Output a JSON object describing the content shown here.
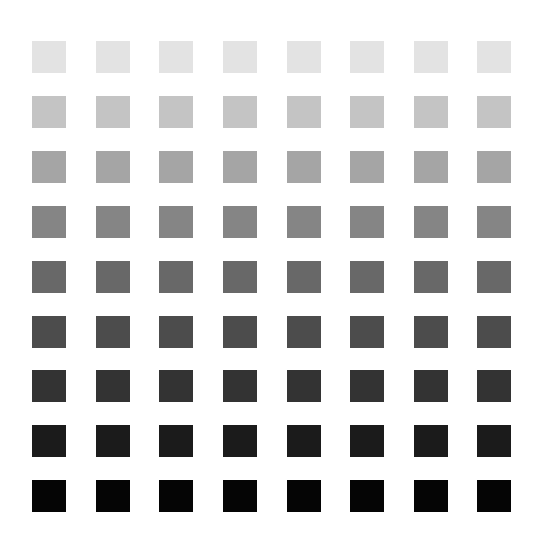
{
  "grid": {
    "columns": 8,
    "rows": 9,
    "col_x": [
      32,
      96,
      159,
      223,
      287,
      350,
      414,
      477
    ],
    "row_y": [
      41,
      96,
      151,
      206,
      261,
      316,
      370,
      425,
      480
    ],
    "square_width": 34,
    "square_height": 32,
    "row_colors": [
      "#e3e3e3",
      "#c4c4c4",
      "#a5a5a5",
      "#858585",
      "#686868",
      "#4c4c4c",
      "#333333",
      "#1b1b1b",
      "#050505"
    ]
  }
}
